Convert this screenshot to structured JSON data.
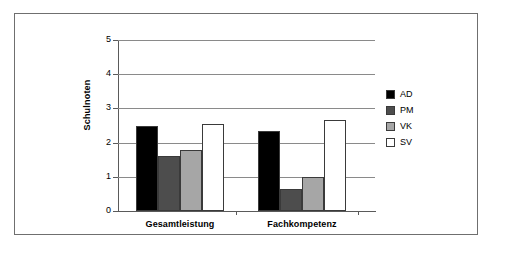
{
  "chart_data": {
    "type": "bar",
    "title": "",
    "subtitle": "",
    "xlabel": "",
    "ylabel": "Schulnoten",
    "categories": [
      "Gesamtleistung",
      "Fachkompetenz"
    ],
    "series": [
      {
        "name": "AD",
        "color": "#000000",
        "values": [
          2.48,
          2.33
        ]
      },
      {
        "name": "PM",
        "color": "#4d4d4d",
        "values": [
          1.61,
          0.65
        ]
      },
      {
        "name": "VK",
        "color": "#a6a6a6",
        "values": [
          1.79,
          1.0
        ]
      },
      {
        "name": "SV",
        "color": "#ffffff",
        "values": [
          2.54,
          2.66
        ]
      }
    ],
    "ylim": [
      0,
      5
    ],
    "ytick_labels": [
      "0",
      "1",
      "2",
      "3",
      "4",
      "5"
    ],
    "ytick_values": [
      0,
      1,
      2,
      3,
      4,
      5
    ],
    "grid": true,
    "grid_axis": "y",
    "legend_position": "right",
    "bar_border_color": "#3a3a3a",
    "gridline_color": "#8a8a8a",
    "axis_color": "#5a5a5a",
    "frame_color": "#6f6f6f",
    "background": "#ffffff"
  }
}
